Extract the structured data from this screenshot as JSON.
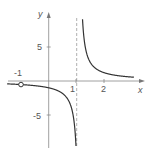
{
  "chart_data": {
    "type": "line",
    "title": "",
    "xlabel": "x",
    "ylabel": "y",
    "function_description": "rational function with vertical asymptote near x = 1.1, horizontal asymptote y = 0, open circle (hole) at x = -1",
    "k": 1.1,
    "asymptote_x": 1.1,
    "hole": {
      "x": -1,
      "y": -0.52
    },
    "x_range": [
      -1.5,
      3.0
    ],
    "y_range": [
      -9,
      9
    ],
    "x_ticks": [
      {
        "value": -1,
        "label": "-1"
      },
      {
        "value": 1,
        "label": "1"
      },
      {
        "value": 2,
        "label": "2"
      }
    ],
    "y_ticks": [
      {
        "value": 5,
        "label": "5"
      },
      {
        "value": -5,
        "label": "-5"
      }
    ],
    "grid": false,
    "legend": null,
    "series": [
      {
        "name": "left branch",
        "x": [
          -1.5,
          -1,
          0,
          0.5,
          0.8,
          0.95,
          1.0,
          0.98
        ],
        "y": [
          -0.42,
          -0.52,
          -1.0,
          -1.83,
          -3.67,
          -7.3,
          -11,
          -9.0
        ]
      },
      {
        "name": "right branch",
        "x": [
          1.22,
          1.3,
          1.5,
          2.0,
          2.5,
          3.0
        ],
        "y": [
          9.0,
          5.5,
          2.75,
          1.22,
          0.79,
          0.58
        ]
      }
    ]
  },
  "labels": {
    "x_axis": "x",
    "y_axis": "y",
    "tick_neg1": "-1",
    "tick_1": "1",
    "tick_2": "2",
    "tick_5": "5",
    "tick_neg5": "-5"
  },
  "colors": {
    "axis": "#888888",
    "curve": "#333333",
    "asymptote": "#999999",
    "text": "#555555"
  }
}
